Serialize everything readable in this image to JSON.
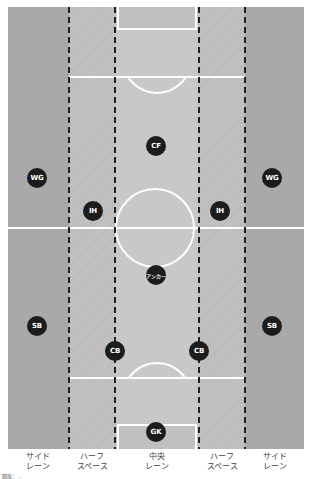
{
  "diagram": {
    "colors": {
      "side_lane": "#a9a9a9",
      "half_space": "#c0c0c0",
      "center_lane": "#c8c8c8",
      "lines": "#ffffff",
      "dividers": "#222222",
      "player": "#1c1c1c"
    },
    "lanes": [
      {
        "id": "side-left",
        "label_line1": "サイド",
        "label_line2": "レーン"
      },
      {
        "id": "half-left",
        "label_line1": "ハーフ",
        "label_line2": "スペース"
      },
      {
        "id": "center",
        "label_line1": "中央",
        "label_line2": "レーン"
      },
      {
        "id": "half-right",
        "label_line1": "ハーフ",
        "label_line2": "スペース"
      },
      {
        "id": "side-right",
        "label_line1": "サイド",
        "label_line2": "レーン"
      }
    ],
    "players": [
      {
        "label": "CF"
      },
      {
        "label": "WG"
      },
      {
        "label": "WG"
      },
      {
        "label": "IH"
      },
      {
        "label": "IH"
      },
      {
        "label": "アンカー"
      },
      {
        "label": "SB"
      },
      {
        "label": "SB"
      },
      {
        "label": "CB"
      },
      {
        "label": "CB"
      },
      {
        "label": "GK"
      }
    ],
    "credit": "図版：…"
  }
}
